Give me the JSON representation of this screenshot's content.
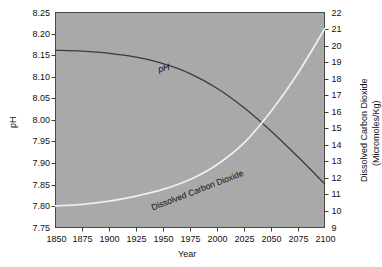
{
  "chart_data": {
    "type": "line",
    "title": "",
    "subtitle": "",
    "xlabel": "Year",
    "ylabel": "pH",
    "y2label": "Dissolved Carbon Dioxide (Micromoles/Kg)",
    "y2label_line1": "Dissolved Carbon Dioxide",
    "y2label_line2": "(Micromoles/Kg)",
    "xlim": [
      1850,
      2100
    ],
    "ylim": [
      7.75,
      8.25
    ],
    "y2lim": [
      9,
      22
    ],
    "grid": false,
    "legend": "inline-curve-labels",
    "plot_background": "#a9a9a9",
    "xticks": [
      1850,
      1875,
      1900,
      1925,
      1950,
      1975,
      2000,
      2025,
      2050,
      2075,
      2100
    ],
    "yticks": [
      7.75,
      7.8,
      7.85,
      7.9,
      7.95,
      8.0,
      8.05,
      8.1,
      8.15,
      8.2,
      8.25
    ],
    "ytick_labels": [
      "7.75",
      "7.80",
      "7.85",
      "7.90",
      "7.95",
      "8.00",
      "8.05",
      "8.10",
      "8.15",
      "8.20",
      "8.25"
    ],
    "y2ticks": [
      9,
      10,
      11,
      12,
      13,
      14,
      15,
      16,
      17,
      18,
      19,
      20,
      21,
      22
    ],
    "x": [
      1850,
      1875,
      1900,
      1925,
      1950,
      1975,
      2000,
      2025,
      2050,
      2075,
      2100
    ],
    "series": [
      {
        "name": "pH",
        "axis": "left",
        "color": "#3b3b3b",
        "label_text": "pH",
        "label_italic": true,
        "values": [
          8.162,
          8.16,
          8.155,
          8.146,
          8.131,
          8.108,
          8.074,
          8.029,
          7.975,
          7.915,
          7.852
        ]
      },
      {
        "name": "Dissolved Carbon Dioxide",
        "axis": "right",
        "color": "#eeeeee",
        "label_text": "Dissolved Carbon Dioxide",
        "label_italic": false,
        "values": [
          10.3,
          10.4,
          10.6,
          10.9,
          11.3,
          11.9,
          12.8,
          14.1,
          16.0,
          18.3,
          21.0
        ]
      }
    ],
    "crossing_year_approx": 2047,
    "annotations": [
      {
        "name": "ph-curve-label",
        "text": "pH",
        "year": 1980,
        "rotation_deg": -14
      },
      {
        "name": "co2-curve-label",
        "text": "Dissolved Carbon Dioxide",
        "year": 1960,
        "rotation_deg": -22
      }
    ]
  }
}
